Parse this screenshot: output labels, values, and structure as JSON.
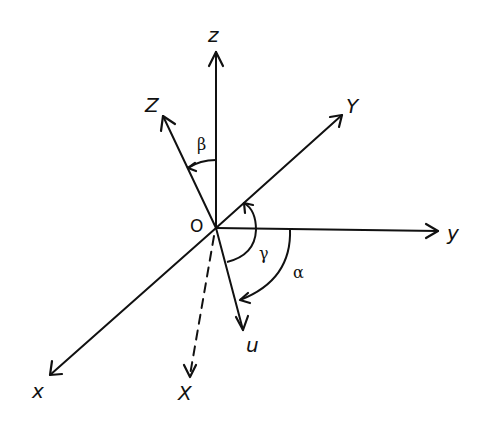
{
  "diagram": {
    "origin_label": "O",
    "axes": [
      {
        "id": "z",
        "label": "z",
        "style": "solid"
      },
      {
        "id": "Z",
        "label": "Z",
        "style": "solid"
      },
      {
        "id": "Y",
        "label": "Y",
        "style": "solid"
      },
      {
        "id": "y",
        "label": "y",
        "style": "solid"
      },
      {
        "id": "x",
        "label": "x",
        "style": "solid"
      },
      {
        "id": "X",
        "label": "X",
        "style": "dashed"
      },
      {
        "id": "u",
        "label": "u",
        "style": "solid"
      }
    ],
    "angles": {
      "alpha": "α",
      "beta": "β",
      "gamma": "γ"
    }
  }
}
